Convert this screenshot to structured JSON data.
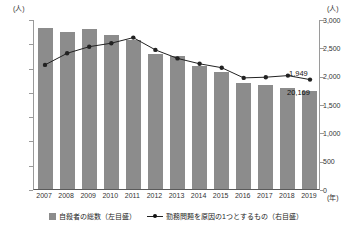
{
  "chart_data": {
    "type": "bar",
    "title": "",
    "subtitle": "",
    "xlabel": "(年)",
    "ylabel": "(人)",
    "y2label": "(人)",
    "grid": false,
    "legend_position": "bottom",
    "categories": [
      "2007",
      "2008",
      "2009",
      "2010",
      "2011",
      "2012",
      "2013",
      "2014",
      "2015",
      "2016",
      "2017",
      "2018",
      "2019"
    ],
    "ylim": [
      0,
      35000
    ],
    "y2lim": [
      0,
      3000
    ],
    "yticks": [
      "0",
      "5,000",
      "10,000",
      "15,000",
      "20,000",
      "25,000",
      "30,000",
      "35,000"
    ],
    "ytick_values": [
      0,
      5000,
      10000,
      15000,
      20000,
      25000,
      30000,
      35000
    ],
    "y2ticks": [
      "0",
      "500",
      "1,000",
      "1,500",
      "2,000",
      "2,500",
      "3,000"
    ],
    "y2tick_values": [
      0,
      500,
      1000,
      1500,
      2000,
      2500,
      3000
    ],
    "series": [
      {
        "name": "自殺者の総数（左目盛）",
        "type": "bar",
        "axis": "left",
        "color": "#8c8c8c",
        "values": [
          33093,
          32249,
          32845,
          31690,
          30651,
          27858,
          27283,
          25427,
          24025,
          21897,
          21321,
          20840,
          20169
        ]
      },
      {
        "name": "勤務問題を原因の1つとするもの（右目盛）",
        "type": "line",
        "axis": "right",
        "color": "#222222",
        "values": [
          2207,
          2412,
          2528,
          2590,
          2689,
          2472,
          2323,
          2227,
          2159,
          1978,
          1991,
          2018,
          1949
        ]
      }
    ],
    "annotations": [
      {
        "label": "1,949",
        "series": "勤務問題を原因の1つとするもの（右目盛）",
        "category": "2019"
      },
      {
        "label": "20,169",
        "series": "自殺者の総数（左目盛）",
        "category": "2019"
      }
    ]
  },
  "axes": {
    "left_unit": "(人)",
    "right_unit": "(人)",
    "x_unit": "(年)"
  },
  "legend": {
    "items": [
      {
        "label": "自殺者の総数（左目盛）",
        "marker": "bar-swatch"
      },
      {
        "label": "勤務問題を原因の1つとするもの（右目盛）",
        "marker": "line-marker"
      }
    ]
  },
  "annotations": {
    "line_last": "1,949",
    "bar_last": "20,169"
  }
}
